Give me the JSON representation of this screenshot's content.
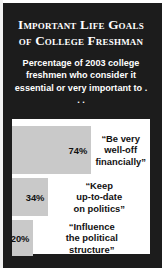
{
  "title": "Important Life Goals of College Freshman",
  "subtitle": "Percentage of 2003 college freshmen who consider it essential or very important to . . .",
  "colors": {
    "card_background": "#1c1c1c",
    "panel_background": "#ffffff",
    "bar_fill": "#c9c9c9",
    "title_text": "#ffffff",
    "label_text": "#111111"
  },
  "chart_data": {
    "type": "bar",
    "orientation": "horizontal",
    "title": "Important Life Goals of College Freshman",
    "subtitle": "Percentage of 2003 college freshmen who consider it essential or very important to . . .",
    "xlabel": "",
    "ylabel": "",
    "xlim": [
      0,
      100
    ],
    "grid": false,
    "legend": false,
    "categories": [
      "“Be very well-off financially”",
      "“Keep up-to-date on politics”",
      "“Influence the political structure”"
    ],
    "values": [
      74,
      34,
      20
    ],
    "value_labels": [
      "74%",
      "34%",
      "20%"
    ],
    "bars": [
      {
        "value": 74,
        "value_label": "74%",
        "label_line1": "“Be very",
        "label_line2": "well-off",
        "label_line3": "financially”",
        "label": "“Be very well-off financially”"
      },
      {
        "value": 34,
        "value_label": "34%",
        "label_line1": "“Keep",
        "label_line2": "up-to-date",
        "label_line3": "on politics”",
        "label": "“Keep up-to-date on politics”"
      },
      {
        "value": 20,
        "value_label": "20%",
        "label_line1": "“Influence",
        "label_line2": "the political",
        "label_line3": "structure”",
        "label": "“Influence the political structure”"
      }
    ]
  }
}
